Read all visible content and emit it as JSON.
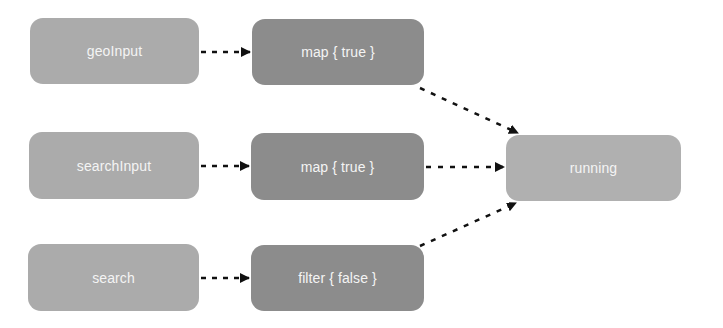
{
  "diagram": {
    "type": "dataflow",
    "nodes": [
      {
        "id": "geoInput",
        "label": "geoInput",
        "kind": "source",
        "x": 30,
        "y": 18,
        "w": 169,
        "h": 66
      },
      {
        "id": "searchInput",
        "label": "searchInput",
        "kind": "source",
        "x": 29,
        "y": 132,
        "w": 170,
        "h": 67
      },
      {
        "id": "search",
        "label": "search",
        "kind": "source",
        "x": 28,
        "y": 244,
        "w": 171,
        "h": 67
      },
      {
        "id": "map1",
        "label": "map { true }",
        "kind": "operator",
        "x": 252,
        "y": 19,
        "w": 172,
        "h": 66
      },
      {
        "id": "map2",
        "label": "map { true }",
        "kind": "operator",
        "x": 251,
        "y": 133,
        "w": 173,
        "h": 67
      },
      {
        "id": "filter",
        "label": "filter { false }",
        "kind": "operator",
        "x": 251,
        "y": 245,
        "w": 173,
        "h": 66
      },
      {
        "id": "running",
        "label": "running",
        "kind": "sink",
        "x": 506,
        "y": 135,
        "w": 175,
        "h": 66
      }
    ],
    "edges": [
      {
        "from": "geoInput",
        "to": "map1",
        "style": "dashed"
      },
      {
        "from": "searchInput",
        "to": "map2",
        "style": "dashed"
      },
      {
        "from": "search",
        "to": "filter",
        "style": "dashed"
      },
      {
        "from": "map1",
        "to": "running",
        "style": "dashed"
      },
      {
        "from": "map2",
        "to": "running",
        "style": "dashed"
      },
      {
        "from": "filter",
        "to": "running",
        "style": "dashed"
      }
    ],
    "colors": {
      "source": "#ababab",
      "operator": "#8c8c8c",
      "sink": "#b0b0b0",
      "label": "#f4f4f4",
      "edge": "#111111"
    }
  }
}
